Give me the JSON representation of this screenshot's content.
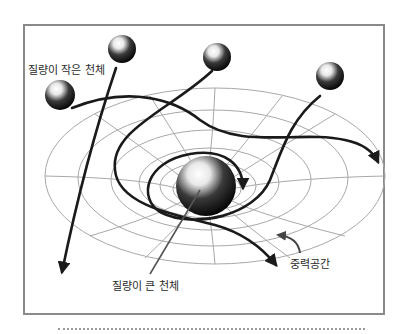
{
  "diagram": {
    "title": "",
    "labels": {
      "small_body": "질량이 작은 천체",
      "large_body": "질량이 큰 천체",
      "gravity_space": "중력공간"
    },
    "colors": {
      "frame_border": "#8a8a8a",
      "grid": "#a8a8a8",
      "trajectory": "#1a1a1a",
      "sphere_dark": "#000000",
      "sphere_light": "#ffffff"
    },
    "bodies": [
      {
        "type": "small",
        "cx": 60,
        "cy": 95,
        "r": 15
      },
      {
        "type": "small",
        "cx": 122,
        "cy": 49,
        "r": 14
      },
      {
        "type": "small",
        "cx": 217,
        "cy": 57,
        "r": 14
      },
      {
        "type": "small",
        "cx": 330,
        "cy": 76,
        "r": 14
      },
      {
        "type": "large",
        "cx": 206,
        "cy": 186,
        "r": 30
      }
    ]
  }
}
